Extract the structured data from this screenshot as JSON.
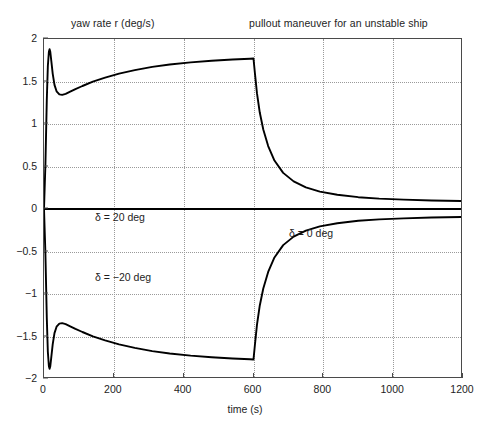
{
  "figure": {
    "title": "pullout maneuver for an unstable ship",
    "top_left_label": "yaw rate r (deg/s)",
    "xlabel": "time (s)"
  },
  "chart_data": {
    "type": "line",
    "title": "pullout maneuver for an unstable ship",
    "subtitle": "yaw rate r (deg/s)",
    "xlabel": "time (s)",
    "ylabel": "yaw rate r (deg/s)",
    "xlim": [
      0,
      1200
    ],
    "ylim": [
      -2,
      2
    ],
    "xticks": [
      0,
      200,
      400,
      600,
      800,
      1000,
      1200
    ],
    "yticks": [
      2,
      1.5,
      1,
      0.5,
      0,
      -0.5,
      -1,
      -1.5,
      -2
    ],
    "grid": true,
    "legend": "none",
    "line_color": "#000000",
    "annotations": [
      {
        "text": "δ = 20 deg",
        "x": 30,
        "y": 0.33
      },
      {
        "text": "δ = −20 deg",
        "x": 30,
        "y": -0.37
      },
      {
        "text": "δ = 0 deg",
        "x": 585,
        "y": 0.16
      }
    ],
    "series": [
      {
        "name": "rudder +20 deg then 0 deg (upper branch)",
        "x": [
          0,
          4,
          8,
          11,
          14,
          16,
          18,
          21,
          25,
          30,
          36,
          44,
          52,
          62,
          75,
          90,
          110,
          140,
          175,
          215,
          260,
          310,
          360,
          420,
          480,
          540,
          590,
          599.5,
          600,
          604,
          610,
          618,
          628,
          642,
          660,
          685,
          715,
          750,
          790,
          840,
          900,
          960,
          1030,
          1110,
          1200
        ],
        "y": [
          0.0,
          0.52,
          1.28,
          1.68,
          1.85,
          1.88,
          1.85,
          1.74,
          1.59,
          1.46,
          1.385,
          1.348,
          1.343,
          1.355,
          1.38,
          1.41,
          1.447,
          1.498,
          1.545,
          1.592,
          1.634,
          1.672,
          1.7,
          1.725,
          1.744,
          1.758,
          1.768,
          1.77,
          1.77,
          1.6,
          1.36,
          1.135,
          0.935,
          0.74,
          0.57,
          0.425,
          0.325,
          0.255,
          0.205,
          0.168,
          0.139,
          0.122,
          0.11,
          0.1,
          0.094
        ]
      },
      {
        "name": "rudder -20 deg then 0 deg (lower branch)",
        "x": [
          0,
          4,
          8,
          11,
          14,
          16,
          18,
          21,
          25,
          30,
          36,
          44,
          52,
          62,
          75,
          90,
          110,
          140,
          175,
          215,
          260,
          310,
          360,
          420,
          480,
          540,
          590,
          599.5,
          600,
          604,
          610,
          618,
          628,
          642,
          660,
          685,
          715,
          750,
          790,
          840,
          900,
          960,
          1030,
          1110,
          1200
        ],
        "y": [
          0.0,
          -0.52,
          -1.28,
          -1.68,
          -1.85,
          -1.88,
          -1.85,
          -1.74,
          -1.59,
          -1.46,
          -1.385,
          -1.348,
          -1.343,
          -1.355,
          -1.38,
          -1.41,
          -1.447,
          -1.498,
          -1.545,
          -1.592,
          -1.634,
          -1.672,
          -1.7,
          -1.725,
          -1.744,
          -1.758,
          -1.768,
          -1.77,
          -1.77,
          -1.6,
          -1.36,
          -1.135,
          -0.935,
          -0.74,
          -0.57,
          -0.425,
          -0.325,
          -0.255,
          -0.205,
          -0.168,
          -0.139,
          -0.122,
          -0.11,
          -0.1,
          -0.094
        ]
      },
      {
        "name": "rudder 0 deg (neutral steady state)",
        "x": [
          0,
          1200
        ],
        "y": [
          0,
          0
        ]
      }
    ]
  }
}
